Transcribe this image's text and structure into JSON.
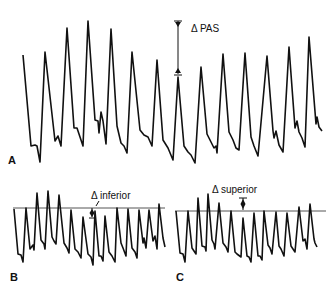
{
  "chart_data": [
    {
      "type": "line",
      "panel": "A",
      "title": "",
      "annotation": "Δ PAS",
      "description": "Arterial pressure waveform with respiratory variation; Δ PAS = difference between maximal and minimal systolic pressure",
      "points": "23,55 31,146 35,145 37,146 40,162 45,52 55,141 58,136 61,146 67,28 74,128 77,128 83,146 88,21 95,120 98,121 99,133 101,112 103,121 106,144 111,29 117,126 121,143 124,146 127,153 132,52 140,130 144,135 148,137 152,146 157,60 163,140 168,148 173,160 178,77 184,146 188,152 191,155 195,163 201,67 207,134 211,142 214,148 216,146 217,153 223,54 229,132 233,140 236,148 239,150 245,53 251,137 254,146 258,156 267,56 273,131 274,138 276,131 279,145 283,152 289,47 295,128 297,121 299,132 302,138 305,147 309,37 316,124 317,117 319,127 322,131"
    },
    {
      "type": "line",
      "panel": "B",
      "annotation": "Δ inferior",
      "baseline_y": 208,
      "points": "14,209 18,254 21,255 23,262 26,208 30,249 33,245 34,250 37,193 41,240 44,244 45,249 48,191 52,237 54,241 56,244 59,195 64,243 67,248 69,253 71,210 75,249 78,252 81,258 83,217 88,254 91,257 93,265 95,211 99,256 101,256 103,261 105,216 109,252 112,256 115,262 117,208 121,243 123,248 126,256 128,209 132,248 135,252 137,258 139,210 143,243 144,238 146,248 149,210 153,241 155,236 157,249 159,204 163,238 165,247"
    },
    {
      "type": "line",
      "panel": "C",
      "annotation": "Δ superior",
      "baseline_y": 211,
      "points": "176,211 180,253 183,254 185,262 188,211 192,248 194,251 196,254 198,198 202,246 205,247 206,251 208,194 212,240 214,244 215,249 219,203 223,243 226,247 228,252 231,211 235,252 237,254 241,257 243,218 247,256 249,257 251,262 254,213 258,256 260,256 262,260 264,211 268,245 270,248 272,254 276,212 279,246 281,249 284,256 287,213 291,246 293,249 295,252 299,207 303,241 305,239 307,249 310,204 314,239 315,243 317,247"
    }
  ],
  "panels": {
    "a_label": "A",
    "b_label": "B",
    "c_label": "C"
  },
  "annotations": {
    "pas": "Δ PAS",
    "inferior": "Δ inferior",
    "superior": "Δ superior"
  }
}
